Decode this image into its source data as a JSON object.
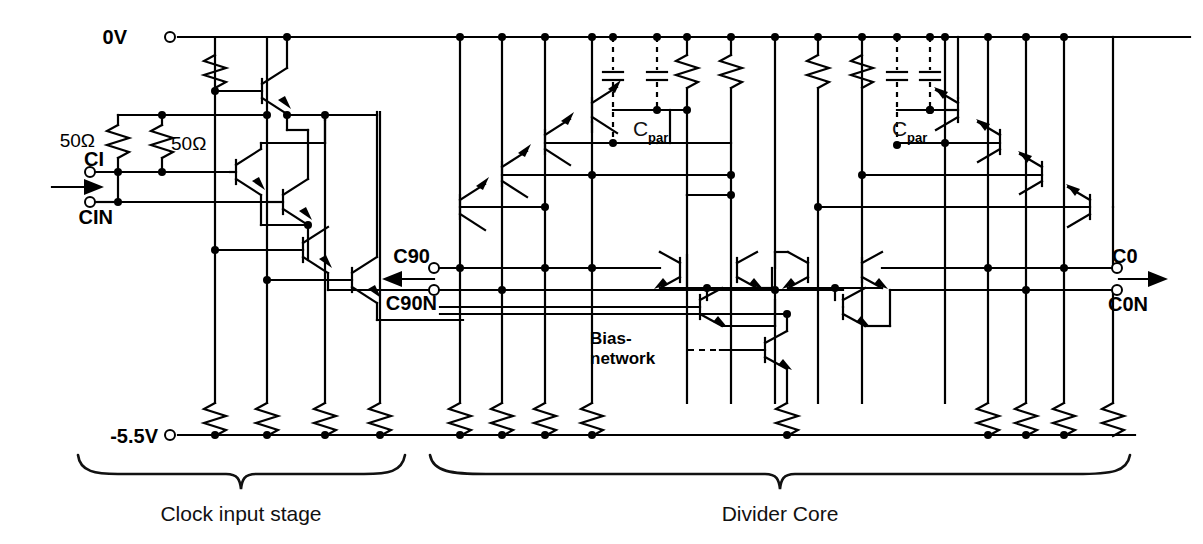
{
  "figure": {
    "type": "schematic-circuit-diagram"
  },
  "rails": {
    "top": {
      "label": "0V",
      "y": 37,
      "terminal_x": 170
    },
    "bottom": {
      "label": "-5.5V",
      "y": 435,
      "terminal_x": 170
    }
  },
  "inputs": [
    {
      "name": "CI",
      "label": "CI",
      "x": 88,
      "y": 172
    },
    {
      "name": "CIN",
      "label": "CIN",
      "x": 88,
      "y": 202
    }
  ],
  "outputs": [
    {
      "name": "C90",
      "label": "C90",
      "x": 432,
      "y": 268,
      "direction": "left"
    },
    {
      "name": "C90N",
      "label": "C90N",
      "x": 432,
      "y": 290,
      "direction": "left"
    },
    {
      "name": "C0",
      "label": "C0",
      "x": 1113,
      "y": 268,
      "direction": "right"
    },
    {
      "name": "C0N",
      "label": "C0N",
      "x": 1113,
      "y": 290,
      "direction": "right"
    }
  ],
  "resistor_labels": [
    {
      "label": "50Ω",
      "x": 55,
      "y": 140,
      "align": "end"
    },
    {
      "label": "50Ω",
      "x": 172,
      "y": 143,
      "align": "start"
    }
  ],
  "capacitor_labels": [
    {
      "base": "C",
      "sub": "par",
      "x": 637,
      "y": 130
    },
    {
      "base": "C",
      "sub": "par",
      "x": 893,
      "y": 130
    }
  ],
  "annotations": [
    {
      "name": "bias-network",
      "line1": "Bias-",
      "line2": "network",
      "x": 590,
      "y": 345
    }
  ],
  "brackets": [
    {
      "name": "clock-input-stage",
      "label": "Clock input stage",
      "x1": 78,
      "x2": 405,
      "y": 462,
      "label_x": 241,
      "label_y": 513
    },
    {
      "name": "divider-core",
      "label": "Divider Core",
      "x1": 430,
      "x2": 1130,
      "y": 462,
      "label_x": 780,
      "label_y": 513
    }
  ],
  "colors": {
    "ink": "#000000",
    "background": "#ffffff"
  }
}
